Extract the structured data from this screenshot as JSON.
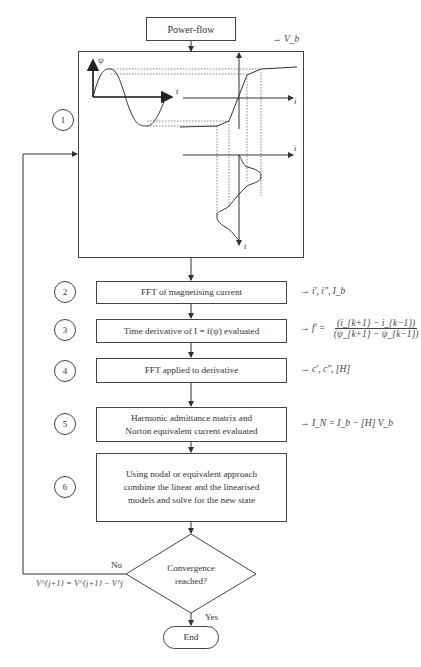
{
  "diagram": {
    "type": "flowchart",
    "start": {
      "label": "Power-flow"
    },
    "step1": {
      "number": "1",
      "annotation": "→ V_b",
      "graph_labels": {
        "flux_axis": "ψ",
        "time_axis_top": "t",
        "current_axis_top": "i",
        "current_axis_bottom": "i",
        "time_axis_bottom": "t"
      }
    },
    "steps": [
      {
        "number": "2",
        "label": "FFT of magnetising current",
        "annotation": "→ i′, i″, I_b"
      },
      {
        "number": "3",
        "label": "Time derivative of I = f(ψ) evaluated",
        "annotation_prefix": "→ f′ =",
        "annotation_numerator": "(i_{k+1} − i_{k−1})",
        "annotation_denominator": "(ψ_{k+1} − ψ_{k−1})"
      },
      {
        "number": "4",
        "label": "FFT applied to derivative",
        "annotation": "→ c′, c″, [H]"
      },
      {
        "number": "5",
        "label_line1": "Harmonic admittance matrix and",
        "label_line2": "Norton equivalent current evaluated",
        "annotation": "→ I_N = I_b − [H] V_b"
      },
      {
        "number": "6",
        "label_line1": "Using nodal or equivalent approach",
        "label_line2": "combine the linear and the linearised",
        "label_line3": "models and solve for the new state"
      }
    ],
    "decision": {
      "line1": "Convergence",
      "line2": "reached?",
      "no_label": "No",
      "yes_label": "Yes",
      "feedback_formula": "V^{j+1} = V^{j+1} − V^j"
    },
    "end": {
      "label": "End"
    }
  }
}
